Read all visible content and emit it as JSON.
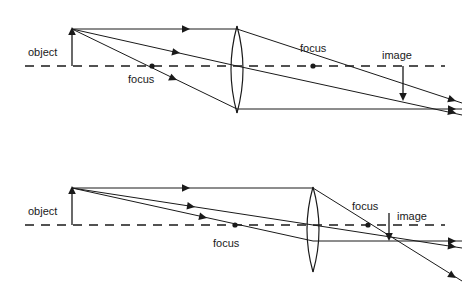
{
  "figure": {
    "background_color": "#ffffff",
    "stroke_color": "#1a1a1a",
    "width": 471,
    "height": 297
  },
  "diagrams": [
    {
      "id": "top-diagram",
      "description": "Object beyond focal point forming a real inverted image",
      "axis": {
        "y": 66,
        "x_start": 25,
        "x_end": 445
      },
      "object": {
        "label": "object",
        "label_x": 28,
        "label_y": 56,
        "x": 72,
        "base_y": 66,
        "tip_y": 29
      },
      "lens": {
        "center_x": 237,
        "top_y": 26,
        "bottom_y": 113,
        "bulge": 12
      },
      "focus_left": {
        "label": "focus",
        "dot_x": 152,
        "dot_y": 66,
        "label_x": 128,
        "label_y": 83
      },
      "focus_right": {
        "label": "focus",
        "dot_x": 313,
        "dot_y": 66,
        "label_x": 300,
        "label_y": 52
      },
      "image": {
        "label": "image",
        "label_x": 382,
        "label_y": 59,
        "x": 403,
        "base_y": 66,
        "tip_y": 100
      },
      "rays": [
        {
          "name": "parallel-ray",
          "incoming": [
            72,
            29,
            237,
            29
          ],
          "outgoing": [
            237,
            29,
            462,
            103
          ],
          "arrow_in_x": 190,
          "arrow_in_y": 29,
          "arrow_in_angle": 0,
          "arrow_out_x": 456,
          "arrow_out_y": 101,
          "arrow_out_angle": 18
        },
        {
          "name": "center-ray",
          "incoming": [
            72,
            29,
            237,
            66
          ],
          "outgoing": [
            237,
            66,
            462,
            115
          ],
          "arrow_in_x": 180,
          "arrow_in_y": 53,
          "arrow_in_angle": 13,
          "arrow_out_x": 456,
          "arrow_out_y": 113,
          "arrow_out_angle": 12
        },
        {
          "name": "focal-ray",
          "incoming": [
            72,
            29,
            237,
            109
          ],
          "outgoing": [
            237,
            109,
            462,
            109
          ],
          "arrow_in_x": 177,
          "arrow_in_y": 80,
          "arrow_in_angle": 26,
          "arrow_out_x": 456,
          "arrow_out_y": 109,
          "arrow_out_angle": 0
        }
      ]
    },
    {
      "id": "bottom-diagram",
      "description": "Object farther away forming a smaller real inverted image nearer the focal point",
      "axis": {
        "y": 225,
        "x_start": 25,
        "x_end": 445
      },
      "object": {
        "label": "object",
        "label_x": 28,
        "label_y": 215,
        "x": 72,
        "base_y": 225,
        "tip_y": 188
      },
      "lens": {
        "center_x": 313,
        "top_y": 187,
        "bottom_y": 272,
        "bulge": 12
      },
      "focus_left": {
        "label": "focus",
        "dot_x": 235,
        "dot_y": 225,
        "label_x": 213,
        "label_y": 247
      },
      "focus_right": {
        "label": "focus",
        "dot_x": 368,
        "dot_y": 225,
        "label_x": 352,
        "label_y": 210
      },
      "image": {
        "label": "image",
        "label_x": 397,
        "label_y": 220,
        "x": 389,
        "base_y": 225,
        "tip_y": 241
      },
      "rays": [
        {
          "name": "parallel-ray",
          "incoming": [
            72,
            188,
            313,
            188
          ],
          "outgoing": [
            313,
            188,
            462,
            281
          ],
          "arrow_in_x": 190,
          "arrow_in_y": 188,
          "arrow_in_angle": 0,
          "arrow_out_x": 456,
          "arrow_out_y": 278,
          "arrow_out_angle": 32
        },
        {
          "name": "center-ray",
          "incoming": [
            72,
            188,
            313,
            225
          ],
          "outgoing": [
            313,
            225,
            462,
            248
          ],
          "arrow_in_x": 195,
          "arrow_in_y": 207,
          "arrow_in_angle": 9,
          "arrow_out_x": 456,
          "arrow_out_y": 247,
          "arrow_out_angle": 9
        },
        {
          "name": "focal-ray",
          "incoming": [
            72,
            188,
            313,
            241
          ],
          "outgoing": [
            313,
            241,
            462,
            241
          ],
          "arrow_in_x": 207,
          "arrow_in_y": 218,
          "arrow_in_angle": 13,
          "arrow_out_x": 456,
          "arrow_out_y": 241,
          "arrow_out_angle": 0
        }
      ]
    }
  ]
}
